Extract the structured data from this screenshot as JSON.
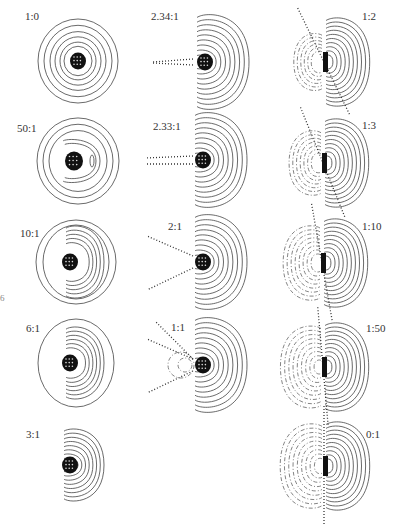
{
  "figure": {
    "edge_mark": "6",
    "legend": {
      "solid": "positive contours",
      "dashed": "negative contours",
      "dotted": "nodal lines"
    },
    "panels": [
      {
        "id": "p1",
        "label": "1:0",
        "column": 1,
        "row": 1,
        "type": "monopole"
      },
      {
        "id": "p2",
        "label": "50:1",
        "column": 1,
        "row": 2,
        "type": "near-monopole"
      },
      {
        "id": "p3",
        "label": "10:1",
        "column": 1,
        "row": 3,
        "type": "mixed-a"
      },
      {
        "id": "p4",
        "label": "6:1",
        "column": 1,
        "row": 4,
        "type": "mixed-b"
      },
      {
        "id": "p5",
        "label": "3:1",
        "column": 1,
        "row": 5,
        "type": "mixed-c"
      },
      {
        "id": "p6",
        "label": "2.34:1",
        "column": 2,
        "row": 1,
        "type": "critical-1"
      },
      {
        "id": "p7",
        "label": "2.33:1",
        "column": 2,
        "row": 2,
        "type": "critical-2"
      },
      {
        "id": "p8",
        "label": "2:1",
        "column": 2,
        "row": 3,
        "type": "split-nodal"
      },
      {
        "id": "p9",
        "label": "1:1",
        "column": 2,
        "row": 4,
        "type": "split-nodal-neg"
      },
      {
        "id": "p10",
        "label": "1:2",
        "column": 3,
        "row": 1,
        "type": "dipole-tilt-1"
      },
      {
        "id": "p11",
        "label": "1:3",
        "column": 3,
        "row": 2,
        "type": "dipole-tilt-2"
      },
      {
        "id": "p12",
        "label": "1:10",
        "column": 3,
        "row": 3,
        "type": "dipole-tilt-3"
      },
      {
        "id": "p13",
        "label": "1:50",
        "column": 3,
        "row": 4,
        "type": "dipole-tilt-4"
      },
      {
        "id": "p14",
        "label": "0:1",
        "column": 3,
        "row": 5,
        "type": "dipole"
      }
    ]
  }
}
